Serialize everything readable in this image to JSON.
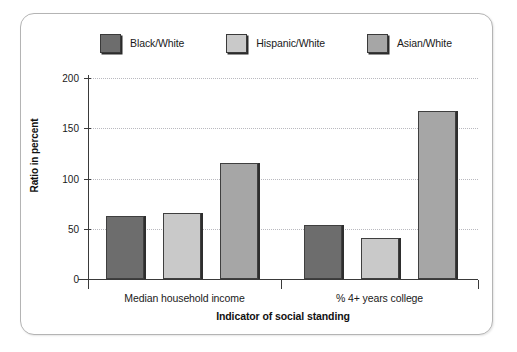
{
  "chart_data": {
    "type": "bar",
    "title": "",
    "xlabel": "Indicator of social standing",
    "ylabel": "Ratio in percent",
    "categories": [
      "Median household income",
      "% 4+ years college"
    ],
    "series": [
      {
        "name": "Black/White",
        "color": "#6d6d6d",
        "values": [
          63,
          54
        ]
      },
      {
        "name": "Hispanic/White",
        "color": "#c9c9c9",
        "values": [
          66,
          41
        ]
      },
      {
        "name": "Asian/White",
        "color": "#a6a6a6",
        "values": [
          115,
          167
        ]
      }
    ],
    "ylim": [
      0,
      200
    ],
    "yticks": [
      0,
      50,
      100,
      150,
      200
    ],
    "ytick_labels": [
      "0",
      "50",
      "100",
      "150",
      "200"
    ],
    "grid": "horizontal-dotted",
    "legend_position": "top"
  },
  "legend": {
    "items": [
      {
        "label": "Black/White"
      },
      {
        "label": "Hispanic/White"
      },
      {
        "label": "Asian/White"
      }
    ]
  },
  "axes": {
    "y_title": "Ratio in percent",
    "x_title": "Indicator of social standing",
    "y_labels": [
      "200",
      "150",
      "100",
      "50",
      "0"
    ],
    "x_labels": [
      "Median household income",
      "% 4+ years college"
    ]
  },
  "colors": {
    "black_white": "#6d6d6d",
    "hispanic_white": "#c9c9c9",
    "asian_white": "#a6a6a6",
    "axis": "#3a3a3a",
    "grid": "#b9b9bf",
    "frame": "#b4b4b4",
    "background": "#ffffff"
  }
}
